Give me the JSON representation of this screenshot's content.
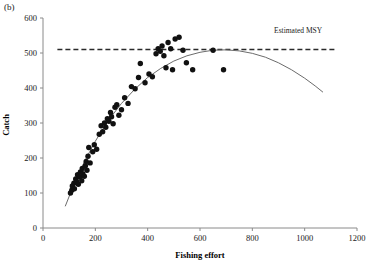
{
  "panel": {
    "label": "(b)"
  },
  "chart_data": {
    "type": "scatter",
    "title": "",
    "xlabel": "Fishing effort",
    "ylabel": "Catch",
    "xlim": [
      0,
      1200
    ],
    "ylim": [
      0,
      600
    ],
    "xticks": [
      0,
      200,
      400,
      600,
      800,
      1000,
      1200
    ],
    "yticks": [
      0,
      100,
      200,
      300,
      400,
      500,
      600
    ],
    "xtick_labels": [
      "0",
      "200",
      "400",
      "600",
      "800",
      "1000",
      "1200"
    ],
    "ytick_labels": [
      "0",
      "100",
      "200",
      "300",
      "400",
      "500",
      "600"
    ],
    "grid": false,
    "legend": null,
    "series": [
      {
        "name": "Observed catch",
        "type": "scatter",
        "marker": "filled-circle",
        "color": "#111111",
        "points": [
          [
            105,
            100
          ],
          [
            110,
            108
          ],
          [
            112,
            120
          ],
          [
            118,
            128
          ],
          [
            120,
            112
          ],
          [
            125,
            140
          ],
          [
            128,
            133
          ],
          [
            132,
            152
          ],
          [
            135,
            125
          ],
          [
            140,
            146
          ],
          [
            143,
            160
          ],
          [
            148,
            135
          ],
          [
            150,
            170
          ],
          [
            152,
            155
          ],
          [
            158,
            148
          ],
          [
            162,
            178
          ],
          [
            165,
            190
          ],
          [
            168,
            165
          ],
          [
            172,
            205
          ],
          [
            175,
            230
          ],
          [
            180,
            186
          ],
          [
            190,
            218
          ],
          [
            196,
            238
          ],
          [
            205,
            225
          ],
          [
            215,
            268
          ],
          [
            222,
            292
          ],
          [
            228,
            275
          ],
          [
            235,
            300
          ],
          [
            240,
            288
          ],
          [
            246,
            312
          ],
          [
            252,
            305
          ],
          [
            258,
            330
          ],
          [
            262,
            318
          ],
          [
            268,
            298
          ],
          [
            275,
            345
          ],
          [
            282,
            352
          ],
          [
            290,
            322
          ],
          [
            300,
            338
          ],
          [
            312,
            372
          ],
          [
            325,
            356
          ],
          [
            338,
            404
          ],
          [
            352,
            398
          ],
          [
            365,
            430
          ],
          [
            372,
            470
          ],
          [
            390,
            415
          ],
          [
            405,
            440
          ],
          [
            418,
            432
          ],
          [
            432,
            498
          ],
          [
            440,
            512
          ],
          [
            448,
            505
          ],
          [
            455,
            520
          ],
          [
            462,
            492
          ],
          [
            470,
            458
          ],
          [
            478,
            530
          ],
          [
            488,
            512
          ],
          [
            495,
            452
          ],
          [
            505,
            540
          ],
          [
            520,
            545
          ],
          [
            535,
            508
          ],
          [
            548,
            472
          ],
          [
            572,
            452
          ],
          [
            650,
            508
          ],
          [
            690,
            452
          ]
        ]
      },
      {
        "name": "Fitted yield curve",
        "type": "line",
        "color": "#6b6b6b",
        "dash": "solid",
        "points": [
          [
            85,
            62
          ],
          [
            120,
            128
          ],
          [
            160,
            192
          ],
          [
            200,
            248
          ],
          [
            250,
            308
          ],
          [
            300,
            356
          ],
          [
            350,
            396
          ],
          [
            400,
            430
          ],
          [
            450,
            456
          ],
          [
            500,
            477
          ],
          [
            550,
            492
          ],
          [
            600,
            502
          ],
          [
            650,
            508
          ],
          [
            700,
            509
          ],
          [
            750,
            506
          ],
          [
            800,
            499
          ],
          [
            850,
            488
          ],
          [
            900,
            472
          ],
          [
            950,
            452
          ],
          [
            1000,
            428
          ],
          [
            1040,
            406
          ],
          [
            1070,
            388
          ]
        ]
      },
      {
        "name": "Estimated MSY",
        "type": "hline",
        "value": 510,
        "color": "#2a2a2a",
        "dash": "dashed",
        "x_start": 55,
        "x_end": 1120,
        "label": "Estimated MSY"
      }
    ],
    "annotations": [
      {
        "text": "Estimated MSY",
        "x": 975,
        "y": 556
      }
    ]
  }
}
